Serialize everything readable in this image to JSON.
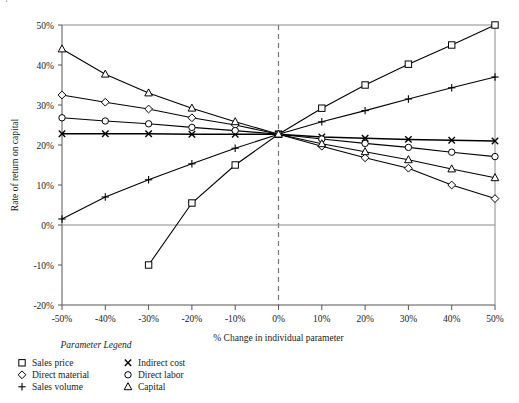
{
  "chart_data": {
    "type": "line",
    "title": "",
    "xlabel": "% Change in individual parameter",
    "ylabel": "Rate of return on capital",
    "x": [
      -50,
      -40,
      -30,
      -20,
      -10,
      0,
      10,
      20,
      30,
      40,
      50
    ],
    "xtick_labels": [
      "-50%",
      "-40%",
      "-30%",
      "-20%",
      "-10%",
      "0%",
      "10%",
      "20%",
      "30%",
      "40%",
      "50%"
    ],
    "ytick_labels": [
      "-20%",
      "-10%",
      "0%",
      "10%",
      "20%",
      "30%",
      "40%",
      "50%"
    ],
    "yticks": [
      -20,
      -10,
      0,
      10,
      20,
      30,
      40,
      50
    ],
    "xlim": [
      -50,
      50
    ],
    "ylim": [
      -20,
      50
    ],
    "grid": false,
    "legend_position": "below-left",
    "base_case_value": 22.7,
    "series": [
      {
        "name": "Sales price",
        "marker": "square",
        "x": [
          -30,
          -20,
          -10,
          0,
          10,
          20,
          30,
          40,
          50
        ],
        "values": [
          -10.0,
          5.5,
          15.0,
          22.7,
          29.2,
          35.0,
          40.2,
          45.0,
          50.0
        ]
      },
      {
        "name": "Direct material",
        "marker": "diamond",
        "x": [
          -50,
          -40,
          -30,
          -20,
          -10,
          0,
          10,
          20,
          30,
          40,
          50
        ],
        "values": [
          32.5,
          30.7,
          29.0,
          26.8,
          25.0,
          22.7,
          19.7,
          16.8,
          14.2,
          10.0,
          6.6
        ]
      },
      {
        "name": "Sales volume",
        "marker": "plus",
        "x": [
          -50,
          -40,
          -30,
          -20,
          -10,
          0,
          10,
          20,
          30,
          40,
          50
        ],
        "values": [
          1.5,
          7.0,
          11.3,
          15.3,
          19.2,
          22.7,
          25.8,
          28.6,
          31.5,
          34.3,
          37.0
        ]
      },
      {
        "name": "Indirect cost",
        "marker": "x",
        "x": [
          -50,
          -40,
          -30,
          -20,
          -10,
          0,
          10,
          20,
          30,
          40,
          50
        ],
        "values": [
          22.8,
          22.8,
          22.8,
          22.7,
          22.7,
          22.7,
          22.0,
          21.7,
          21.4,
          21.2,
          21.0
        ]
      },
      {
        "name": "Direct labor",
        "marker": "circle",
        "x": [
          -50,
          -40,
          -30,
          -20,
          -10,
          0,
          10,
          20,
          30,
          40,
          50
        ],
        "values": [
          26.8,
          26.0,
          25.3,
          24.4,
          23.6,
          22.7,
          21.5,
          20.4,
          19.4,
          18.2,
          17.1
        ]
      },
      {
        "name": "Capital",
        "marker": "triangle",
        "x": [
          -50,
          -40,
          -30,
          -20,
          -10,
          0,
          10,
          20,
          30,
          40,
          50
        ],
        "values": [
          44.0,
          37.7,
          33.0,
          29.2,
          25.8,
          22.7,
          20.3,
          18.3,
          16.3,
          14.0,
          11.8
        ]
      }
    ]
  },
  "legend": {
    "title": "Parameter Legend",
    "entries": [
      {
        "label": "Sales price",
        "marker": "square"
      },
      {
        "label": "Indirect cost",
        "marker": "x"
      },
      {
        "label": "Direct material",
        "marker": "diamond"
      },
      {
        "label": "Direct labor",
        "marker": "circle"
      },
      {
        "label": "Sales volume",
        "marker": "plus"
      },
      {
        "label": "Capital",
        "marker": "triangle"
      }
    ]
  },
  "colors": {
    "ink": "#000000",
    "axis": "#555555",
    "frame": "#8a8a8a",
    "background": "#ffffff"
  }
}
